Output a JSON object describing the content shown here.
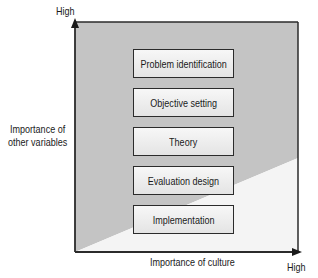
{
  "diagram": {
    "y_axis": {
      "title_line1": "Importance of",
      "title_line2": "other variables",
      "high_label": "High"
    },
    "x_axis": {
      "title": "Importance of culture",
      "high_label": "High"
    },
    "stages": [
      {
        "label": "Problem identification"
      },
      {
        "label": "Objective setting"
      },
      {
        "label": "Theory"
      },
      {
        "label": "Evaluation design"
      },
      {
        "label": "Implementation"
      }
    ],
    "colors": {
      "shaded_region": "#c4c4c4",
      "unshaded_region": "#f4f4f4",
      "axis": "#2b2b2b"
    }
  }
}
